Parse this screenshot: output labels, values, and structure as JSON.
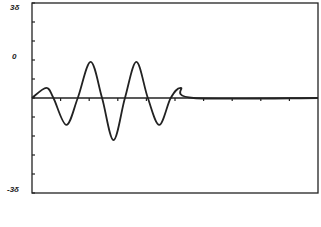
{
  "chart_data": {
    "type": "line",
    "title": "",
    "xlabel": "",
    "ylabel": "",
    "ylim": [
      -3,
      3
    ],
    "y_tick_labels": [
      {
        "label": "3δ",
        "value": 3
      },
      {
        "label": "0",
        "value": 1.5
      },
      {
        "label": "-3δ",
        "value": -3
      }
    ],
    "y_minor_ticks": 10,
    "x_ticks": 10,
    "grid": false,
    "series": [
      {
        "name": "wave packet",
        "points": [
          [
            0.0,
            0.0
          ],
          [
            0.5,
            0.32
          ],
          [
            0.75,
            0.0
          ],
          [
            1.2,
            -0.85
          ],
          [
            1.6,
            0.0
          ],
          [
            2.05,
            1.14
          ],
          [
            2.45,
            0.0
          ],
          [
            2.85,
            -1.33
          ],
          [
            3.25,
            0.0
          ],
          [
            3.65,
            1.14
          ],
          [
            4.05,
            0.0
          ],
          [
            4.45,
            -0.85
          ],
          [
            4.85,
            0.0
          ],
          [
            5.2,
            0.32
          ],
          [
            5.65,
            0.0
          ],
          [
            10.0,
            0.0
          ]
        ]
      }
    ],
    "colors": {
      "line": "#222222",
      "axis": "#222222",
      "background": "#ffffff"
    }
  }
}
